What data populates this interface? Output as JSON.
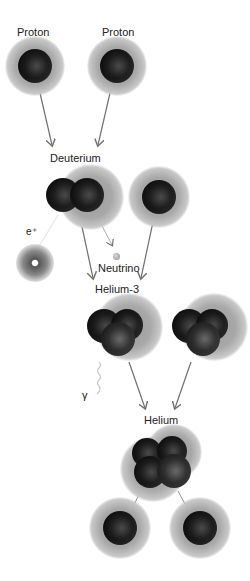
{
  "diagram": {
    "labels": {
      "proton_left": "Proton",
      "proton_right": "Proton",
      "deuterium": "Deuterium",
      "positron": "e⁺",
      "neutrino": "Neutrino",
      "helium3": "Helium-3",
      "gamma": "γ",
      "helium": "Helium"
    },
    "stages": [
      {
        "name": "Proton",
        "count": 2
      },
      {
        "name": "Deuterium",
        "byproducts": [
          "e⁺",
          "Neutrino"
        ],
        "plus": "Proton"
      },
      {
        "name": "Helium-3",
        "count": 2,
        "byproducts": [
          "γ"
        ]
      },
      {
        "name": "Helium",
        "byproducts": [
          "Proton",
          "Proton"
        ]
      }
    ],
    "colors": {
      "background": "#ffffff",
      "particle": "#111111",
      "halo": "#a0a0a0",
      "arrow": "#707070",
      "text": "#222222"
    }
  }
}
